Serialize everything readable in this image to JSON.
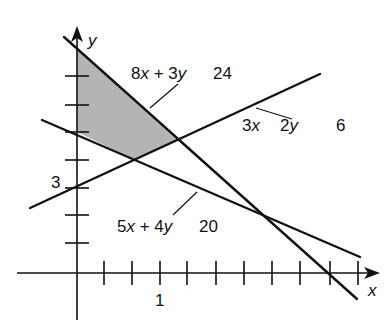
{
  "diagram": {
    "type": "linear-programming-feasible-region",
    "axes": {
      "x_label": "x",
      "y_label": "y",
      "x_tick_label": "1",
      "y_tick_label": "3"
    },
    "constraints": [
      {
        "id": "c1",
        "expression": "8x + 3y",
        "relation": "",
        "rhs": "24",
        "label_left": "8",
        "label_var1": "x",
        "label_op": " + 3",
        "label_var2": "y"
      },
      {
        "id": "c2",
        "expression": "3x 2y",
        "relation": "",
        "rhs": "6",
        "label_left": "3",
        "label_var1": "x",
        "label_mid": "2",
        "label_var2": "y"
      },
      {
        "id": "c3",
        "expression": "5x + 4y",
        "relation": "",
        "rhs": "20",
        "label_left": "5",
        "label_var1": "x",
        "label_op": " + 4",
        "label_var2": "y"
      }
    ],
    "feasible_region": {
      "fill": "#b4b4b4",
      "description": "shaded quadrilateral bounded by y-axis and the three constraint lines"
    },
    "colors": {
      "line": "#111111",
      "shade": "#b4b4b4",
      "background": "#ffffff"
    }
  }
}
